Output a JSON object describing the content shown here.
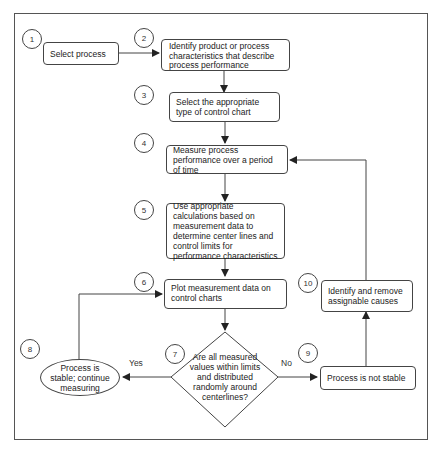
{
  "diagram": {
    "type": "flowchart",
    "title": "",
    "steps": [
      {
        "id": "1",
        "label": "Select process"
      },
      {
        "id": "2",
        "label": "Identify product or process characteristics that describe process performance"
      },
      {
        "id": "3",
        "label": "Select the appropriate type of control chart"
      },
      {
        "id": "4",
        "label": "Measure process performance over a period of time"
      },
      {
        "id": "5",
        "label": "Use appropriate calculations based on measurement data to determine center lines and control limits for performance characteristics"
      },
      {
        "id": "6",
        "label": "Plot measurement data on control charts"
      },
      {
        "id": "7",
        "label": "Are all measured values within limits and distributed randomly around centerlines?"
      },
      {
        "id": "8",
        "label": "Process is stable; continue measuring"
      },
      {
        "id": "9",
        "label": "Process is not stable"
      },
      {
        "id": "10",
        "label": "Identify and remove assignable causes"
      }
    ],
    "edge_labels": {
      "yes": "Yes",
      "no": "No"
    },
    "edges": [
      {
        "from": "1",
        "to": "2"
      },
      {
        "from": "2",
        "to": "3"
      },
      {
        "from": "3",
        "to": "4"
      },
      {
        "from": "4",
        "to": "5"
      },
      {
        "from": "5",
        "to": "6"
      },
      {
        "from": "6",
        "to": "7"
      },
      {
        "from": "7",
        "to": "8",
        "label": "Yes"
      },
      {
        "from": "7",
        "to": "9",
        "label": "No"
      },
      {
        "from": "8",
        "to": "6"
      },
      {
        "from": "9",
        "to": "10"
      },
      {
        "from": "10",
        "to": "4"
      }
    ],
    "colors": {
      "stroke": "#444444",
      "background": "#ffffff",
      "text": "#222222"
    }
  }
}
